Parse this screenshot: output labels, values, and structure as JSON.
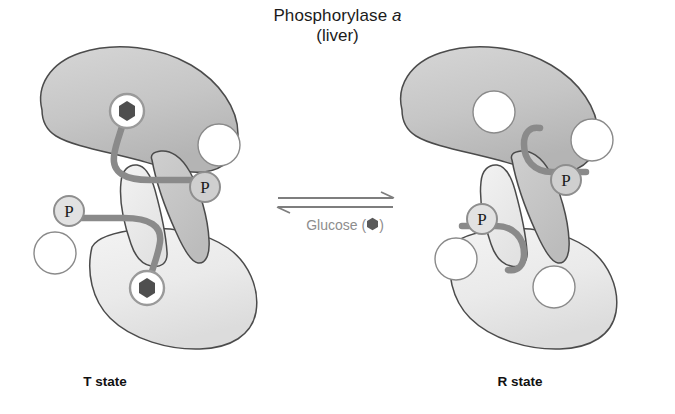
{
  "figure": {
    "title": {
      "line1_prefix": "Phosphorylase ",
      "line1_italic": "a",
      "line2": "(liver)"
    },
    "equilibrium": {
      "caption_text": "Glucose ",
      "caption_open_paren": "(",
      "caption_close_paren": ")",
      "ligand_symbol": "hexagon",
      "forward_direction": "right",
      "reverse_direction": "left"
    },
    "states": [
      {
        "id": "t-state",
        "label": "T state",
        "subunits": [
          {
            "id": "t-upper",
            "position": "upper",
            "fill": "#c9c9c9",
            "catalytic_site": {
              "occupied": true,
              "ligand": "glucose-hexagon"
            },
            "allosteric_site": {
              "occupied": false
            },
            "phosphate_label": "P"
          },
          {
            "id": "t-lower",
            "position": "lower",
            "fill": "#ececec",
            "catalytic_site": {
              "occupied": true,
              "ligand": "glucose-hexagon"
            },
            "allosteric_site": {
              "occupied": false
            },
            "phosphate_label": "P"
          }
        ]
      },
      {
        "id": "r-state",
        "label": "R state",
        "subunits": [
          {
            "id": "r-upper",
            "position": "upper",
            "fill": "#c9c9c9",
            "catalytic_site": {
              "occupied": false
            },
            "allosteric_site": {
              "occupied": false
            },
            "phosphate_label": "P"
          },
          {
            "id": "r-lower",
            "position": "lower",
            "fill": "#ececec",
            "catalytic_site": {
              "occupied": false
            },
            "allosteric_site": {
              "occupied": false
            },
            "phosphate_label": "P"
          }
        ]
      }
    ],
    "colors": {
      "subunit_dark": "#c9c9c9",
      "subunit_light": "#ececec",
      "outline": "#4b4b4b",
      "tube": "#8a8a8a",
      "hexagon": "#4f4f4f",
      "site_ring": "#9a9a9a",
      "site_fill": "#ffffff",
      "phosphate_ring": "#8e8e8e",
      "text_dark": "#1b1b1b",
      "caption_gray": "#8d8d8d"
    }
  }
}
